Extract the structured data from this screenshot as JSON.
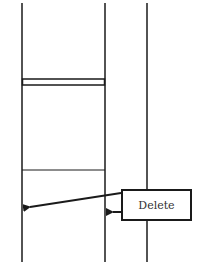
{
  "diagram": {
    "callout": {
      "label": "Delete"
    },
    "colors": {
      "line": "#1a1a1a",
      "background": "#ffffff",
      "text": "#333333"
    }
  }
}
